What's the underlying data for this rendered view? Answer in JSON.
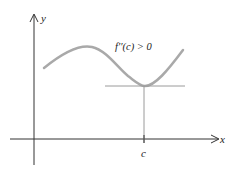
{
  "diagram": {
    "axes": {
      "x_label": "x",
      "y_label": "y"
    },
    "annotation": "f′′(c) > 0",
    "tick_label": "c",
    "colors": {
      "curve": "#a9a9a9",
      "axis": "#333333",
      "tangent": "#9a9a9a"
    }
  }
}
